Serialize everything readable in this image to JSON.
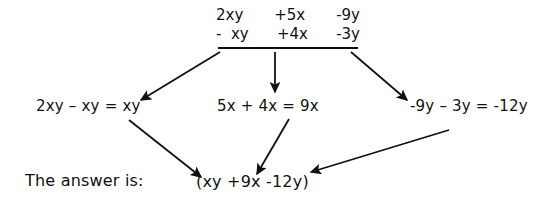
{
  "diagram": {
    "background_color": "#ffffff",
    "ink_color": "#111111",
    "expression": {
      "minuend": {
        "terms": [
          "2xy",
          "+5x",
          "-9y"
        ],
        "text": "2xy  +5x   -9y"
      },
      "subtrahend": {
        "terms": [
          "-  xy",
          "+4x",
          "-3y"
        ],
        "text": "-  xy   +4x   -3y"
      }
    },
    "steps": [
      {
        "id": "left",
        "text": "2xy – xy = xy"
      },
      {
        "id": "center",
        "text": "5x + 4x = 9x"
      },
      {
        "id": "right",
        "text": "-9y – 3y = -12y"
      }
    ],
    "answer": {
      "label": "The answer is:",
      "value": "(xy +9x -12y)"
    },
    "arrows": [
      {
        "name": "arrow-expression-to-left",
        "from": [
          220,
          52
        ],
        "to": [
          141,
          100
        ]
      },
      {
        "name": "arrow-expression-to-center",
        "from": [
          275,
          52
        ],
        "to": [
          275,
          92
        ]
      },
      {
        "name": "arrow-expression-to-right",
        "from": [
          351,
          52
        ],
        "to": [
          407,
          100
        ]
      },
      {
        "name": "arrow-left-to-answer",
        "from": [
          129,
          120
        ],
        "to": [
          201,
          177
        ]
      },
      {
        "name": "arrow-center-to-answer",
        "from": [
          289,
          119
        ],
        "to": [
          257,
          174
        ]
      },
      {
        "name": "arrow-right-to-answer",
        "from": [
          449,
          130
        ],
        "to": [
          311,
          172
        ]
      }
    ]
  }
}
